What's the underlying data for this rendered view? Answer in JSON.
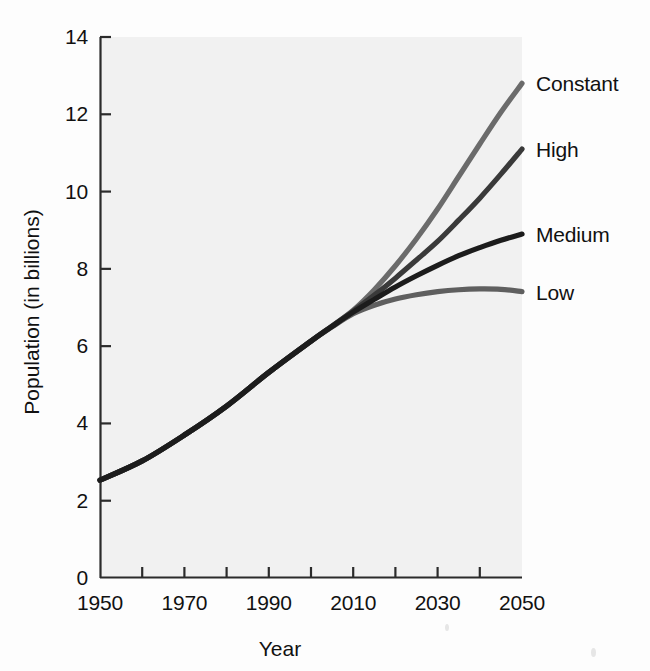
{
  "figure": {
    "background_color": "#fdfdfd",
    "plot_background_color": "#f1f1f1",
    "axis_color": "#2b2b2b"
  },
  "chart_data": {
    "type": "line",
    "title": "",
    "xlabel": "Year",
    "ylabel": "Population (in billions)",
    "xlim": [
      1950,
      2050
    ],
    "ylim": [
      0,
      14
    ],
    "xticks": [
      1950,
      1960,
      1970,
      1980,
      1990,
      2000,
      2010,
      2020,
      2030,
      2040,
      2050
    ],
    "xtick_labels": [
      "1950",
      "",
      "1970",
      "",
      "1990",
      "",
      "2010",
      "",
      "2030",
      "",
      "2050"
    ],
    "xtick_labels_shown": [
      "1950",
      "1970",
      "1990",
      "2010",
      "2030",
      "2050"
    ],
    "yticks": [
      0,
      2,
      4,
      6,
      8,
      10,
      12,
      14
    ],
    "ytick_labels": [
      "0",
      "2",
      "4",
      "6",
      "8",
      "10",
      "12",
      "14"
    ],
    "grid": false,
    "legend_position": "right-of-axes-inline-labels",
    "x": [
      1950,
      1960,
      1970,
      1980,
      1990,
      2000,
      2005,
      2010,
      2015,
      2020,
      2025,
      2030,
      2035,
      2040,
      2045,
      2050
    ],
    "series": [
      {
        "name": "Constant",
        "color": "#6b6b6b",
        "label": "Constant",
        "end_value": 12.8,
        "values": [
          2.53,
          3.03,
          3.7,
          4.45,
          5.32,
          6.13,
          6.52,
          6.93,
          7.46,
          8.08,
          8.78,
          9.55,
          10.39,
          11.23,
          12.05,
          12.8
        ]
      },
      {
        "name": "High",
        "color": "#3a3a3a",
        "label": "High",
        "end_value": 11.1,
        "values": [
          2.53,
          3.03,
          3.7,
          4.45,
          5.32,
          6.13,
          6.52,
          6.91,
          7.32,
          7.76,
          8.23,
          8.71,
          9.26,
          9.83,
          10.45,
          11.1
        ]
      },
      {
        "name": "Medium",
        "color": "#1c1c1c",
        "label": "Medium",
        "end_value": 8.9,
        "values": [
          2.53,
          3.03,
          3.7,
          4.45,
          5.32,
          6.13,
          6.51,
          6.88,
          7.21,
          7.53,
          7.82,
          8.09,
          8.34,
          8.55,
          8.74,
          8.9
        ]
      },
      {
        "name": "Low",
        "color": "#5f5f5f",
        "label": "Low",
        "end_value": 7.4,
        "values": [
          2.53,
          3.03,
          3.7,
          4.45,
          5.32,
          6.13,
          6.5,
          6.84,
          7.06,
          7.22,
          7.33,
          7.41,
          7.46,
          7.48,
          7.47,
          7.41
        ]
      }
    ]
  }
}
